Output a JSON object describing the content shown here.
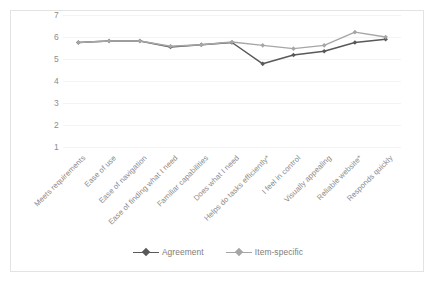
{
  "chart_data": {
    "type": "line",
    "title": "",
    "xlabel": "",
    "ylabel": "",
    "ylim": [
      1,
      7
    ],
    "yticks": [
      7,
      6,
      5,
      4,
      3,
      2,
      1
    ],
    "grid": true,
    "legend_position": "bottom",
    "categories": [
      "Meets requirements",
      "Ease of use",
      "Ease of navigation",
      "Ease of finding what I need",
      "Familiar capabilities",
      "Does what I need",
      "Helps do tasks efficiently*",
      "I feel in control",
      "Visually appealing",
      "Reliable website*",
      "Responds quickly"
    ],
    "series": [
      {
        "name": "Agreement",
        "color": "#595959",
        "values": [
          5.75,
          5.82,
          5.82,
          5.55,
          5.65,
          5.75,
          4.78,
          5.18,
          5.35,
          5.75,
          5.9
        ]
      },
      {
        "name": "Item-specific",
        "color": "#a6a6a6",
        "values": [
          5.75,
          5.82,
          5.82,
          5.58,
          5.65,
          5.77,
          5.62,
          5.47,
          5.62,
          6.22,
          6.0
        ]
      }
    ]
  },
  "legend": {
    "entries": [
      {
        "label": "Agreement"
      },
      {
        "label": "Item-specific"
      }
    ]
  },
  "colors": {
    "frame_border": "#e3e3e3",
    "gridline": "#f4f4f4",
    "tick_text": "#8c8c8c",
    "category_text": "#8a8a8a",
    "legend_text": "#7d7d7d",
    "agreement": "#595959",
    "item_specific": "#a6a6a6",
    "background": "#ffffff"
  }
}
